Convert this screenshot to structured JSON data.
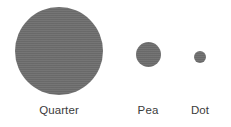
{
  "figure": {
    "type": "size-comparison-diagram",
    "background_color": "#ffffff",
    "width": 231,
    "height": 127,
    "fill_color": "#7b7b7b",
    "label_color": "#3b3b3b",
    "texture": "halftone-vertical-line-dither",
    "items": [
      {
        "id": "quarter",
        "label": "Quarter",
        "shape": "circle",
        "diameter_px": 88,
        "center_x": 59,
        "center_y": 51
      },
      {
        "id": "pea",
        "label": "Pea",
        "shape": "circle",
        "diameter_px": 25,
        "center_x": 148,
        "center_y": 54
      },
      {
        "id": "dot",
        "label": "Dot",
        "shape": "circle",
        "diameter_px": 12,
        "center_x": 200,
        "center_y": 57
      }
    ]
  },
  "chart_data": {
    "type": "bar",
    "title": "",
    "subtitle": "",
    "xlabel": "",
    "ylabel": "",
    "categories": [
      "Quarter",
      "Pea",
      "Dot"
    ],
    "values": [
      88,
      25,
      12
    ],
    "value_unit": "px diameter",
    "series": [
      {
        "name": "Relative size (circle diameter)",
        "values": [
          88,
          25,
          12
        ]
      }
    ],
    "grid": false,
    "legend": false,
    "annotations": []
  }
}
